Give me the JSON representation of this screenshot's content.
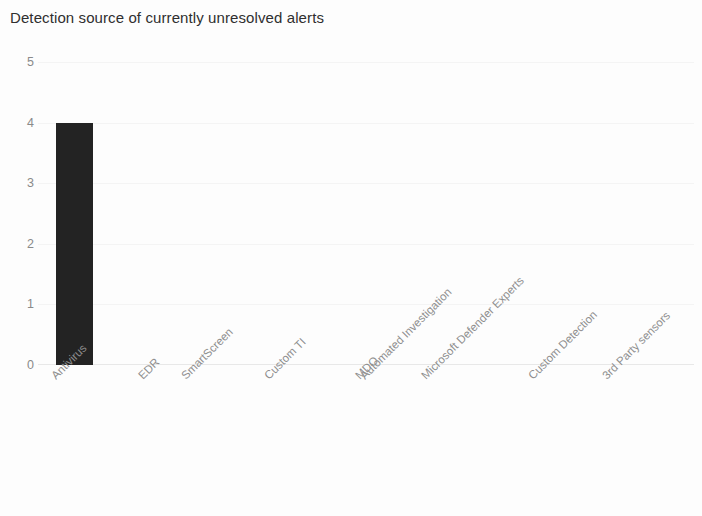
{
  "chart_data": {
    "type": "bar",
    "title": "Detection source of currently unresolved alerts",
    "xlabel": "",
    "ylabel": "",
    "ylim": [
      0,
      5
    ],
    "yticks": [
      0,
      1,
      2,
      3,
      4,
      5
    ],
    "ytick_labels": [
      "0",
      "1",
      "2",
      "3",
      "4",
      "5"
    ],
    "grid": true,
    "legend": null,
    "bar_color": "#232323",
    "categories": [
      "Antivirus",
      "EDR",
      "SmartScreen",
      "Custom TI",
      "MDO",
      "Automated Investigation",
      "Microsoft Defender Experts",
      "Custom Detection",
      "3rd Party sensors"
    ],
    "values": [
      4,
      0,
      0,
      0,
      0,
      0,
      0,
      0,
      0
    ],
    "series": [
      {
        "name": "Unresolved alerts",
        "values": [
          4,
          0,
          0,
          0,
          0,
          0,
          0,
          0,
          0
        ]
      }
    ]
  }
}
